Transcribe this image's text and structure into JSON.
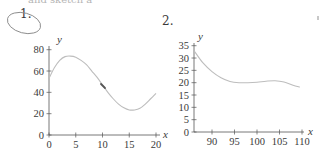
{
  "header_fragment": "and sketch a",
  "plots": [
    {
      "label": "1.",
      "circled": true
    },
    {
      "label": "2.",
      "circled": false
    }
  ],
  "colors": {
    "text": "#3a3a3a",
    "axis": "#555555",
    "curve": "#bdbdbd",
    "circle": "#8a8a8a",
    "pencil_mark": "#555555"
  },
  "chart_data": [
    {
      "type": "line",
      "title": "1.",
      "xlabel": "x",
      "ylabel": "y",
      "xlim": [
        0,
        20
      ],
      "ylim": [
        0,
        80
      ],
      "x_ticks": [
        0,
        5,
        10,
        15,
        20
      ],
      "y_ticks": [
        0,
        20,
        40,
        60,
        80
      ],
      "grid": false,
      "legend": null,
      "series": [
        {
          "name": "curve",
          "x": [
            0,
            1,
            2,
            3,
            4,
            5,
            6,
            7,
            8,
            9,
            10,
            11,
            12,
            13,
            14,
            15,
            16,
            17,
            18,
            19,
            20
          ],
          "y": [
            53,
            63,
            70,
            73.5,
            74,
            73,
            70,
            66,
            60,
            54,
            47,
            40,
            34,
            29,
            25.5,
            23.5,
            23.5,
            25,
            29,
            34,
            39
          ]
        }
      ],
      "annotations": [
        "pencil mark on curve near x=10"
      ]
    },
    {
      "type": "line",
      "title": "2.",
      "xlabel": "x",
      "ylabel": "y",
      "xlim": [
        86,
        110
      ],
      "ylim": [
        0,
        35
      ],
      "x_ticks": [
        90,
        95,
        100,
        105,
        110
      ],
      "y_ticks": [
        0,
        5,
        10,
        15,
        20,
        25,
        30,
        35
      ],
      "grid": false,
      "legend": null,
      "series": [
        {
          "name": "curve",
          "x": [
            86,
            88,
            90,
            92,
            94,
            96,
            98,
            100,
            102,
            104,
            106,
            108,
            109.5
          ],
          "y": [
            33,
            28,
            24.5,
            22,
            20.5,
            20,
            20,
            20.2,
            20.6,
            20.8,
            20.3,
            19,
            18.2
          ]
        }
      ]
    }
  ]
}
